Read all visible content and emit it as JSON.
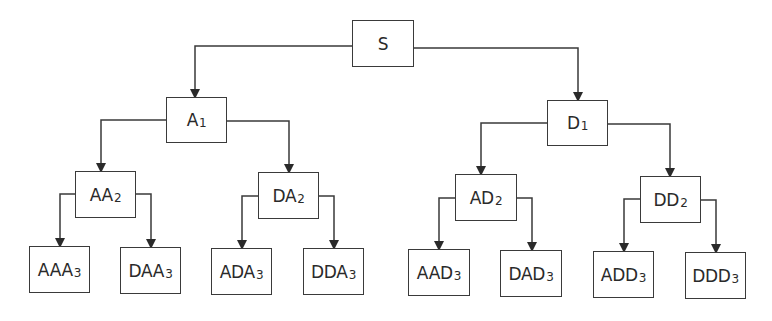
{
  "diagram": {
    "type": "tree",
    "nodes": [
      {
        "id": "S",
        "base": "S",
        "sub": "",
        "x": 352,
        "y": 20,
        "w": 62,
        "h": 47
      },
      {
        "id": "A1",
        "base": "A",
        "sub": "1",
        "x": 166,
        "y": 97,
        "w": 61,
        "h": 46
      },
      {
        "id": "D1",
        "base": "D",
        "sub": "1",
        "x": 547,
        "y": 100,
        "w": 61,
        "h": 46
      },
      {
        "id": "AA2",
        "base": "AA",
        "sub": "2",
        "x": 75,
        "y": 171,
        "w": 61,
        "h": 47
      },
      {
        "id": "DA2",
        "base": "DA",
        "sub": "2",
        "x": 258,
        "y": 172,
        "w": 61,
        "h": 47
      },
      {
        "id": "AD2",
        "base": "AD",
        "sub": "2",
        "x": 455,
        "y": 174,
        "w": 62,
        "h": 47
      },
      {
        "id": "DD2",
        "base": "DD",
        "sub": "2",
        "x": 640,
        "y": 176,
        "w": 61,
        "h": 47
      },
      {
        "id": "AAA3",
        "base": "AAA",
        "sub": "3",
        "x": 29,
        "y": 246,
        "w": 61,
        "h": 47
      },
      {
        "id": "DAA3",
        "base": "DAA",
        "sub": "3",
        "x": 120,
        "y": 247,
        "w": 61,
        "h": 47
      },
      {
        "id": "ADA3",
        "base": "ADA",
        "sub": "3",
        "x": 211,
        "y": 248,
        "w": 61,
        "h": 47
      },
      {
        "id": "DDA3",
        "base": "DDA",
        "sub": "3",
        "x": 303,
        "y": 248,
        "w": 61,
        "h": 47
      },
      {
        "id": "AAD3",
        "base": "AAD",
        "sub": "3",
        "x": 408,
        "y": 249,
        "w": 62,
        "h": 47
      },
      {
        "id": "DAD3",
        "base": "DAD",
        "sub": "3",
        "x": 500,
        "y": 250,
        "w": 62,
        "h": 47
      },
      {
        "id": "ADD3",
        "base": "ADD",
        "sub": "3",
        "x": 593,
        "y": 251,
        "w": 61,
        "h": 47
      },
      {
        "id": "DDD3",
        "base": "DDD",
        "sub": "3",
        "x": 685,
        "y": 252,
        "w": 61,
        "h": 47
      }
    ],
    "edges": [
      {
        "from": "S",
        "to": "A1",
        "path": "M352,46 L195,46 L195,97"
      },
      {
        "from": "S",
        "to": "D1",
        "path": "M414,48 L578,48 L578,100"
      },
      {
        "from": "A1",
        "to": "AA2",
        "path": "M166,120 L101,120 L101,171"
      },
      {
        "from": "A1",
        "to": "DA2",
        "path": "M227,121 L289,121 L289,172"
      },
      {
        "from": "D1",
        "to": "AD2",
        "path": "M547,123 L481,123 L481,174"
      },
      {
        "from": "D1",
        "to": "DD2",
        "path": "M608,124 L670,124 L670,176"
      },
      {
        "from": "AA2",
        "to": "AAA3",
        "path": "M75,194 L60,194 L60,246"
      },
      {
        "from": "AA2",
        "to": "DAA3",
        "path": "M136,194 L151,194 L151,247"
      },
      {
        "from": "DA2",
        "to": "ADA3",
        "path": "M258,196 L242,196 L242,248"
      },
      {
        "from": "DA2",
        "to": "DDA3",
        "path": "M319,196 L334,196 L334,248"
      },
      {
        "from": "AD2",
        "to": "AAD3",
        "path": "M455,198 L439,198 L439,249"
      },
      {
        "from": "AD2",
        "to": "DAD3",
        "path": "M517,198 L532,198 L532,250"
      },
      {
        "from": "DD2",
        "to": "ADD3",
        "path": "M640,199 L624,199 L624,251"
      },
      {
        "from": "DD2",
        "to": "DDD3",
        "path": "M701,200 L716,200 L716,252"
      }
    ],
    "colors": {
      "stroke": "#3a3a3a",
      "text": "#2a2a2a",
      "background": "#ffffff"
    }
  }
}
